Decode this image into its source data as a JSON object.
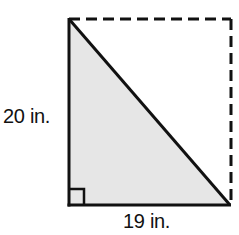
{
  "figure": {
    "type": "right-triangle-in-rectangle",
    "labels": {
      "height": "20 in.",
      "base": "19 in."
    },
    "colors": {
      "stroke": "#111111",
      "triangle_fill": "#e6e6e6",
      "background": "#ffffff"
    },
    "shapes": {
      "triangle": {
        "description": "Shaded right triangle with right angle at bottom-left",
        "vertices": [
          [
            69,
            19
          ],
          [
            69,
            205
          ],
          [
            230,
            205
          ]
        ],
        "right_angle_marker": true
      },
      "rectangle_completion": {
        "description": "Dashed lines completing the rectangle along the top and right sides",
        "style": "dashed"
      }
    }
  }
}
